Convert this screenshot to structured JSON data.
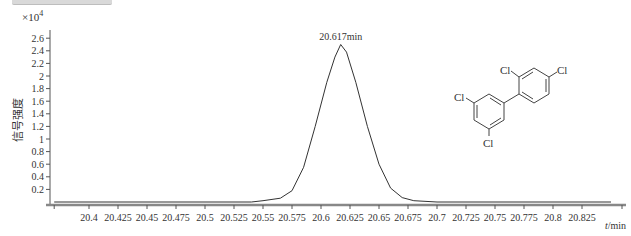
{
  "chart_data": {
    "type": "line",
    "title": "",
    "xlabel": "t/min",
    "ylabel": "信号强度",
    "y_multiplier": "×10^4",
    "xlim": [
      20.37,
      20.85
    ],
    "ylim": [
      0,
      2.7
    ],
    "grid": false,
    "x_ticks": [
      "20.4",
      "20.425",
      "20.45",
      "20.475",
      "20.5",
      "20.525",
      "20.55",
      "20.575",
      "20.6",
      "20.625",
      "20.65",
      "20.675",
      "20.7",
      "20.725",
      "20.75",
      "20.775",
      "20.8",
      "20.825"
    ],
    "y_ticks": [
      "0.2",
      "0.4",
      "0.6",
      "0.8",
      "1",
      "1.2",
      "1.4",
      "1.6",
      "1.8",
      "2",
      "2.2",
      "2.4",
      "2.6"
    ],
    "series": [
      {
        "name": "chromatogram",
        "x": [
          20.37,
          20.5,
          20.54,
          20.55,
          20.565,
          20.575,
          20.585,
          20.595,
          20.605,
          20.612,
          20.617,
          20.622,
          20.63,
          20.64,
          20.65,
          20.66,
          20.67,
          20.68,
          20.7,
          20.85
        ],
        "y": [
          0.0,
          0.0,
          0.0,
          0.02,
          0.06,
          0.18,
          0.55,
          1.2,
          1.9,
          2.3,
          2.5,
          2.38,
          1.9,
          1.2,
          0.6,
          0.22,
          0.07,
          0.02,
          0.0,
          0.0
        ]
      }
    ],
    "annotations": [
      {
        "text": "20.617min",
        "x": 20.617,
        "y": 2.5,
        "type": "peak-label"
      }
    ],
    "inset": {
      "type": "chemical-structure",
      "compound": "tetrachlorobiphenyl",
      "substituent_labels": [
        "Cl",
        "Cl",
        "Cl",
        "Cl"
      ]
    }
  },
  "labels": {
    "multiplier_base": "×10",
    "multiplier_exp": "4",
    "ylabel": "信号强度",
    "xlabel_var": "t",
    "xlabel_unit": "/min",
    "peak": "20.617min",
    "cl": "Cl"
  }
}
